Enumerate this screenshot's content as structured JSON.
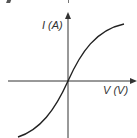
{
  "diagram": {
    "title": "",
    "y_axis_label": "I (A)",
    "x_axis_label": "V (V)",
    "curve": "S-shaped I-V characteristic passing through origin",
    "colors": {
      "axis": "#333333",
      "curve": "#222222",
      "background": "#ffffff"
    }
  }
}
